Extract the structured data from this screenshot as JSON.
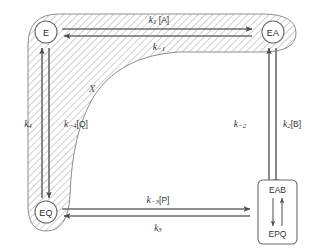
{
  "figure": {
    "type": "reaction-mechanism-diagram",
    "colors": {
      "stroke": "#555555",
      "hatch": "#b9b9b9",
      "hatch_fill": "#ffffff",
      "text": "#333333",
      "arrow_fill": "#d9d9d9",
      "background": "#ffffff"
    }
  },
  "nodes": {
    "e": {
      "label": "E",
      "x": 46,
      "y": 32
    },
    "ea": {
      "label": "EA",
      "x": 273,
      "y": 32
    },
    "eq": {
      "label": "EQ",
      "x": 46,
      "y": 212
    },
    "complex_box": {
      "top_label": "EAB",
      "bottom_label": "EPQ",
      "x": 277,
      "y": 212
    }
  },
  "region": {
    "label": "X"
  },
  "edges": [
    {
      "id": "e-to-ea",
      "from": "E",
      "to": "EA",
      "label": "k₁[A]",
      "rate_symbol": "k",
      "subscript": "1",
      "species": "[A]",
      "direction": "right",
      "position": "top"
    },
    {
      "id": "ea-to-e",
      "from": "EA",
      "to": "E",
      "label": "k₋₁",
      "rate_symbol": "k",
      "subscript": "−1",
      "species": "",
      "direction": "left",
      "position": "top"
    },
    {
      "id": "ea-to-eab",
      "from": "EA",
      "to": "EAB",
      "label": "k₂[B]",
      "rate_symbol": "k",
      "subscript": "2",
      "species": "[B]",
      "direction": "down",
      "position": "right"
    },
    {
      "id": "eab-to-ea",
      "from": "EAB",
      "to": "EA",
      "label": "k₋₂",
      "rate_symbol": "k",
      "subscript": "−2",
      "species": "",
      "direction": "up",
      "position": "right"
    },
    {
      "id": "eq-to-epq",
      "from": "EQ",
      "to": "EPQ",
      "label": "k₋₃[P]",
      "rate_symbol": "k",
      "subscript": "−3",
      "species": "[P]",
      "direction": "right",
      "position": "bottom"
    },
    {
      "id": "epq-to-eq",
      "from": "EPQ",
      "to": "EQ",
      "label": "k₃",
      "rate_symbol": "k",
      "subscript": "3",
      "species": "",
      "direction": "left",
      "position": "bottom"
    },
    {
      "id": "eq-to-e",
      "from": "EQ",
      "to": "E",
      "label": "k₄",
      "rate_symbol": "k",
      "subscript": "4",
      "species": "",
      "direction": "up",
      "position": "left"
    },
    {
      "id": "e-to-eq",
      "from": "E",
      "to": "EQ",
      "label": "k₋₄[Q]",
      "rate_symbol": "k",
      "subscript": "−4",
      "species": "[Q]",
      "direction": "down",
      "position": "left"
    }
  ],
  "labels": {
    "k1A": "k1[A]",
    "km1": "k-1",
    "k2B": "k2[B]",
    "km2": "k-2",
    "km3P": "k-3[P]",
    "k3": "k3",
    "k4": "k4",
    "km4Q": "k-4[Q]",
    "region_x": "X",
    "node_e": "E",
    "node_ea": "EA",
    "node_eq": "EQ",
    "box_eab": "EAB",
    "box_epq": "EPQ"
  }
}
